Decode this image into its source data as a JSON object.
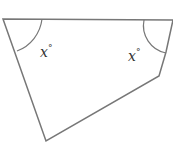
{
  "diagram": {
    "shape": "pentagon",
    "stroke_color": "#777777",
    "vertices": [
      [
        3,
        19
      ],
      [
        173,
        20
      ],
      [
        166,
        52
      ],
      [
        159,
        76
      ],
      [
        46,
        141
      ]
    ],
    "angles": [
      {
        "name": "top-left-angle",
        "label": "x",
        "unit": "°"
      },
      {
        "name": "top-right-angle",
        "label": "x",
        "unit": "°"
      }
    ]
  }
}
